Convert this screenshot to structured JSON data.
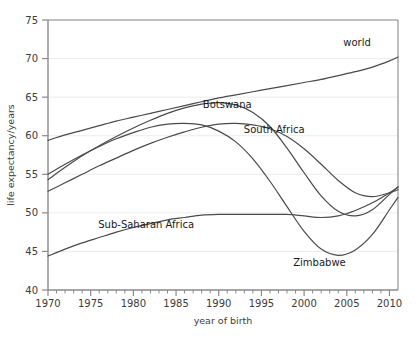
{
  "chart_data": {
    "type": "line",
    "title": "",
    "xlabel": "year of birth",
    "ylabel": "life expectancy/years",
    "xlim": [
      1970,
      2011
    ],
    "ylim": [
      40,
      75
    ],
    "xticks": [
      1970,
      1975,
      1980,
      1985,
      1990,
      1995,
      2000,
      2005,
      2010
    ],
    "xtick_labels": [
      "1970",
      "1975",
      "1980",
      "1985",
      "1990",
      "1995",
      "2000",
      "2005",
      "2010"
    ],
    "x_minor_tick_step": 1,
    "yticks": [
      40,
      45,
      50,
      55,
      60,
      65,
      70,
      75
    ],
    "ytick_labels": [
      "40",
      "45",
      "50",
      "55",
      "60",
      "65",
      "70",
      "75"
    ],
    "grid": "horizontal-major-only",
    "legend": "inline-labels",
    "line_color": "#4a4a4a",
    "grid_color": "#ececec",
    "axis_color": "#8a8a8a",
    "x": [
      1970,
      1972,
      1974,
      1976,
      1978,
      1980,
      1982,
      1984,
      1986,
      1988,
      1990,
      1992,
      1994,
      1996,
      1998,
      2000,
      2002,
      2004,
      2006,
      2008,
      2010,
      2011
    ],
    "series": [
      {
        "name": "world",
        "label": "world",
        "label_x": 2006.2,
        "label_y": 71.6,
        "values": [
          59.4,
          60.1,
          60.7,
          61.3,
          61.9,
          62.4,
          62.9,
          63.4,
          63.9,
          64.4,
          64.9,
          65.3,
          65.7,
          66.1,
          66.5,
          66.9,
          67.3,
          67.8,
          68.3,
          68.9,
          69.7,
          70.2
        ]
      },
      {
        "name": "botswana",
        "label": "Botswana",
        "label_x": 1991.0,
        "label_y": 63.6,
        "values": [
          54.3,
          55.9,
          57.4,
          58.7,
          59.9,
          61.0,
          62.0,
          62.9,
          63.6,
          64.1,
          64.3,
          64.0,
          63.0,
          61.2,
          58.4,
          55.2,
          52.2,
          50.2,
          49.6,
          50.4,
          52.4,
          53.4
        ]
      },
      {
        "name": "south-africa",
        "label": "South Africa",
        "label_x": 1996.5,
        "label_y": 60.3,
        "values": [
          52.8,
          53.9,
          55.0,
          56.1,
          57.1,
          58.1,
          59.0,
          59.8,
          60.5,
          61.1,
          61.5,
          61.6,
          61.4,
          60.9,
          59.9,
          58.3,
          56.3,
          54.2,
          52.6,
          52.1,
          52.6,
          53.0
        ]
      },
      {
        "name": "zimbabwe",
        "label": "Zimbabwe",
        "label_x": 2001.8,
        "label_y": 43.1,
        "values": [
          55.0,
          56.3,
          57.5,
          58.6,
          59.6,
          60.4,
          61.1,
          61.5,
          61.6,
          61.4,
          60.6,
          59.2,
          57.0,
          54.1,
          50.8,
          47.6,
          45.3,
          44.5,
          45.2,
          47.2,
          50.4,
          52.0
        ]
      },
      {
        "name": "sub-saharan-africa",
        "label": "Sub-Saharan Africa",
        "label_x": 1981.5,
        "label_y": 48.0,
        "values": [
          44.4,
          45.3,
          46.1,
          46.8,
          47.5,
          48.1,
          48.6,
          49.1,
          49.4,
          49.7,
          49.8,
          49.8,
          49.8,
          49.8,
          49.8,
          49.6,
          49.4,
          49.6,
          50.3,
          51.3,
          52.6,
          53.3
        ]
      }
    ]
  },
  "caption_sliver": " "
}
